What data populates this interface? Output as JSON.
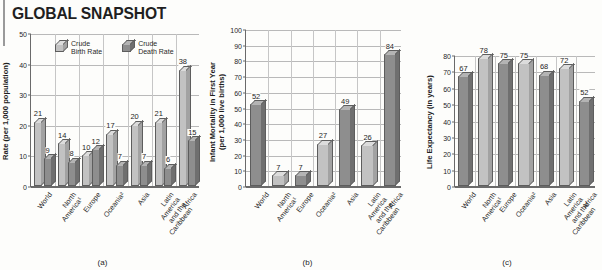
{
  "figure": {
    "title": "GLOBAL SNAPSHOT",
    "panel_labels": [
      "(a)",
      "(b)",
      "(c)"
    ]
  },
  "legend": {
    "items": [
      {
        "label": "Crude\nBirth Rate",
        "shade": "light"
      },
      {
        "label": "Crude\nDeath Rate",
        "shade": "dark"
      }
    ]
  },
  "categories": [
    "World",
    "North America¹",
    "Europe",
    "Oceania²",
    "Asia",
    "Latin America\nand the\nCaribbean",
    "Africa"
  ],
  "chart_data": [
    {
      "type": "bar",
      "panel": "(a)",
      "title": "",
      "ylabel": "Rate (per 1,000 population)",
      "xlabel": "",
      "ylim": [
        0,
        50
      ],
      "yticks": [
        0,
        10,
        20,
        30,
        40,
        50
      ],
      "grid": true,
      "legend_position": "top-inside",
      "categories": [
        "World",
        "North America¹",
        "Europe",
        "Oceania²",
        "Asia",
        "Latin America and the Caribbean",
        "Africa"
      ],
      "series": [
        {
          "name": "Crude Birth Rate",
          "values": [
            21,
            14,
            10,
            17,
            20,
            21,
            38
          ]
        },
        {
          "name": "Crude Death Rate",
          "values": [
            9,
            8,
            12,
            7,
            7,
            6,
            15
          ]
        }
      ]
    },
    {
      "type": "bar",
      "panel": "(b)",
      "title": "",
      "ylabel": "Infant Mortality in First Year\n(per 1,000 live births)",
      "xlabel": "",
      "ylim": [
        0,
        100
      ],
      "yticks": [
        0,
        10,
        20,
        30,
        40,
        50,
        60,
        70,
        80,
        90,
        100
      ],
      "grid": true,
      "categories": [
        "World",
        "North America¹",
        "Europe",
        "Oceania²",
        "Asia",
        "Latin America and the Caribbean",
        "Africa"
      ],
      "values": [
        52,
        7,
        7,
        27,
        49,
        26,
        84
      ]
    },
    {
      "type": "bar",
      "panel": "(c)",
      "title": "",
      "ylabel": "Life Expectancy (in years)",
      "xlabel": "",
      "ylim": [
        0,
        80
      ],
      "yticks": [
        0,
        10,
        20,
        30,
        40,
        50,
        60,
        70,
        80
      ],
      "grid": true,
      "categories": [
        "World",
        "North America¹",
        "Europe",
        "Oceania²",
        "Asia",
        "Latin America and the Caribbean",
        "Africa"
      ],
      "values": [
        67,
        78,
        75,
        75,
        68,
        72,
        52
      ]
    }
  ]
}
